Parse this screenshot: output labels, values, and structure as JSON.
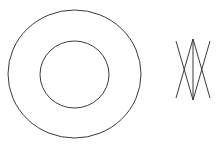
{
  "diagram": {
    "background": "#ffffff",
    "stroke_color": "#3a3a3a",
    "concentric_circles": {
      "outer": {
        "cx": 74.5,
        "cy": 74,
        "rx": 66.5,
        "ry": 64
      },
      "inner": {
        "cx": 74.5,
        "cy": 74.5,
        "rx": 34.5,
        "ry": 33.5
      }
    },
    "crossed_lines_figure": {
      "lines": [
        {
          "x1": 193,
          "y1": 39,
          "x2": 193,
          "y2": 100
        },
        {
          "x1": 176,
          "y1": 41,
          "x2": 193,
          "y2": 100
        },
        {
          "x1": 210,
          "y1": 41,
          "x2": 193,
          "y2": 100
        },
        {
          "x1": 193,
          "y1": 39,
          "x2": 176,
          "y2": 98
        },
        {
          "x1": 193,
          "y1": 39,
          "x2": 210,
          "y2": 98
        }
      ]
    }
  }
}
